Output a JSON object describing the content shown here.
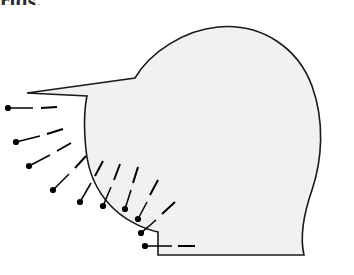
{
  "figure": {
    "caption_fragment": "rids.",
    "title": ""
  },
  "style": {
    "region_fill": "#f1f1f1",
    "region_stroke": "#1a1a1a",
    "region_stroke_width": 1.6,
    "marker_color": "#000000",
    "marker_radius": 3.1,
    "leader_color": "#000000",
    "leader_width": 1.5,
    "dash_color": "#000000",
    "dash_width": 2.0,
    "background": "#ffffff"
  },
  "region": {
    "name": "shaded-region",
    "path": "M 27 93 L 135 78 C 150 52 185 30 218 27 C 262 23 298 48 312 86 C 325 122 322 160 312 190 C 303 216 300 238 304 255 L 158 255 L 158 232 C 140 228 122 218 110 205 C 96 190 88 170 86 150 C 84 130 84 110 87 96 Z",
    "vertices": [
      {
        "name": "left-top-corner",
        "x": 27,
        "y": 93
      },
      {
        "name": "ridge-vertex",
        "x": 135,
        "y": 78
      },
      {
        "name": "bottom-left-corner",
        "x": 158,
        "y": 255
      },
      {
        "name": "bottom-right-corner",
        "x": 304,
        "y": 255
      }
    ]
  },
  "normals": [
    {
      "id": 1,
      "dot_x": 8,
      "dot_y": 108,
      "tip_x": 33,
      "tip_y": 108,
      "dash_from_x": 41,
      "dash_from_y": 108,
      "dash_to_x": 57,
      "dash_to_y": 107,
      "angle_deg": 180
    },
    {
      "id": 2,
      "dot_x": 16,
      "dot_y": 142,
      "tip_x": 40,
      "tip_y": 136,
      "dash_from_x": 47,
      "dash_from_y": 134,
      "dash_to_x": 63,
      "dash_to_y": 129,
      "angle_deg": 194
    },
    {
      "id": 3,
      "dot_x": 29,
      "dot_y": 166,
      "tip_x": 50,
      "tip_y": 155,
      "dash_from_x": 57,
      "dash_from_y": 151,
      "dash_to_x": 71,
      "dash_to_y": 143,
      "angle_deg": 208
    },
    {
      "id": 4,
      "dot_x": 53,
      "dot_y": 190,
      "tip_x": 69,
      "tip_y": 174,
      "dash_from_x": 75,
      "dash_from_y": 168,
      "dash_to_x": 86,
      "dash_to_y": 156,
      "angle_deg": 224
    },
    {
      "id": 5,
      "dot_x": 80,
      "dot_y": 202,
      "tip_x": 91,
      "tip_y": 183,
      "dash_from_x": 95,
      "dash_from_y": 176,
      "dash_to_x": 103,
      "dash_to_y": 161,
      "angle_deg": 240
    },
    {
      "id": 6,
      "dot_x": 103,
      "dot_y": 206,
      "tip_x": 111,
      "tip_y": 187,
      "dash_from_x": 114,
      "dash_from_y": 180,
      "dash_to_x": 120,
      "dash_to_y": 164,
      "angle_deg": 247
    },
    {
      "id": 7,
      "dot_x": 125,
      "dot_y": 209,
      "tip_x": 131,
      "tip_y": 190,
      "dash_from_x": 133,
      "dash_from_y": 183,
      "dash_to_x": 138,
      "dash_to_y": 167,
      "angle_deg": 252
    },
    {
      "id": 8,
      "dot_x": 138,
      "dot_y": 219,
      "tip_x": 147,
      "tip_y": 202,
      "dash_from_x": 150,
      "dash_from_y": 195,
      "dash_to_x": 158,
      "dash_to_y": 180,
      "angle_deg": 242
    },
    {
      "id": 9,
      "dot_x": 141,
      "dot_y": 233,
      "tip_x": 156,
      "tip_y": 220,
      "dash_from_x": 162,
      "dash_from_y": 214,
      "dash_to_x": 175,
      "dash_to_y": 202,
      "angle_deg": 221
    },
    {
      "id": 10,
      "dot_x": 145,
      "dot_y": 246,
      "tip_x": 172,
      "tip_y": 246,
      "dash_from_x": 178,
      "dash_from_y": 246,
      "dash_to_x": 195,
      "dash_to_y": 246,
      "angle_deg": 180
    }
  ]
}
